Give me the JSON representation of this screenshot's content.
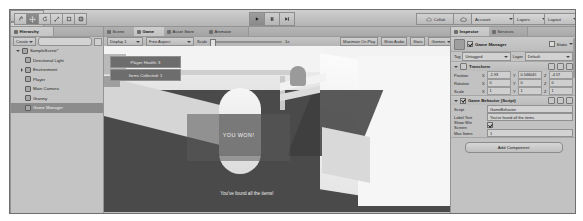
{
  "app": {
    "name": "Unity Editor"
  },
  "toolbar": {
    "tools": [
      {
        "name": "hand-tool",
        "icon": "hand-icon",
        "active": false
      },
      {
        "name": "move-tool",
        "icon": "move-icon",
        "active": true
      },
      {
        "name": "rotate-tool",
        "icon": "rotate-icon",
        "active": false
      },
      {
        "name": "scale-tool",
        "icon": "scale-icon",
        "active": false
      },
      {
        "name": "rect-tool",
        "icon": "rect-icon",
        "active": false
      },
      {
        "name": "transform-tool",
        "icon": "transform-icon",
        "active": false
      }
    ],
    "pivot_label": "Pivot",
    "local_label": "Local",
    "play_label": "play-icon",
    "pause_label": "pause-icon",
    "step_label": "step-icon",
    "play_active": true,
    "collab_label": "Collab",
    "cloud_label": "cloud-icon",
    "account_label": "Account",
    "layers_label": "Layers",
    "layout_label": "Layout"
  },
  "hierarchy": {
    "tab_label": "Hierarchy",
    "create_label": "Create",
    "search_placeholder": "",
    "items": [
      {
        "label": "SampleScene*",
        "depth": 0,
        "expanded": true,
        "selected": false,
        "is_scene": true
      },
      {
        "label": "Directional Light",
        "depth": 1,
        "expanded": false,
        "selected": false
      },
      {
        "label": "Environment",
        "depth": 1,
        "expanded": false,
        "selected": false,
        "has_children": true
      },
      {
        "label": "Player",
        "depth": 1,
        "expanded": false,
        "selected": false
      },
      {
        "label": "Main Camera",
        "depth": 1,
        "expanded": false,
        "selected": false
      },
      {
        "label": "Granny",
        "depth": 1,
        "expanded": false,
        "selected": false
      },
      {
        "label": "Game Manager",
        "depth": 1,
        "expanded": false,
        "selected": true
      }
    ]
  },
  "dock": {
    "tabs": [
      {
        "label": "Scene",
        "selected": false,
        "icon": "scene-icon"
      },
      {
        "label": "Game",
        "selected": true,
        "icon": "game-icon"
      },
      {
        "label": "Asset Store",
        "selected": false,
        "icon": "store-icon"
      },
      {
        "label": "Animator",
        "selected": false,
        "icon": "animator-icon"
      }
    ],
    "game_toolbar": {
      "display": "Display 1",
      "aspect": "Free Aspect",
      "scale_label": "Scale",
      "scale_value": "1x",
      "maximize_label": "Maximize On Play",
      "mute_label": "Mute Audio",
      "stats_label": "Stats",
      "gizmos_label": "Gizmos"
    }
  },
  "game": {
    "hud_buttons": [
      {
        "label": "Player Health: 3"
      },
      {
        "label": "Items Collected: 1"
      }
    ],
    "win_title": "YOU WON!",
    "win_subtitle": "You've found all the items!"
  },
  "inspector": {
    "tabs": [
      {
        "label": "Inspector",
        "selected": true,
        "icon": "inspector-icon"
      },
      {
        "label": "Services",
        "selected": false,
        "icon": "services-icon"
      }
    ],
    "object": {
      "name": "Game Manager",
      "enabled": true,
      "static_label": "Static",
      "tag_label": "Tag",
      "tag_value": "Untagged",
      "layer_label": "Layer",
      "layer_value": "Default"
    },
    "components": [
      {
        "title": "Transform",
        "type": "transform",
        "rows": [
          {
            "label": "Position",
            "x": "-1.93",
            "y": "0.546045",
            "z": "-4.57"
          },
          {
            "label": "Rotation",
            "x": "0",
            "y": "0",
            "z": "0"
          },
          {
            "label": "Scale",
            "x": "1",
            "y": "1",
            "z": "1"
          }
        ]
      },
      {
        "title": "Game Behavior (Script)",
        "type": "script",
        "enabled": true,
        "script_label": "Script",
        "script_value": "GameBehavior",
        "properties": [
          {
            "label": "Label Text",
            "value": "You've found all the items",
            "kind": "text"
          },
          {
            "label": "Show Win Screen",
            "value": true,
            "kind": "bool"
          },
          {
            "label": "Max Items",
            "value": "1",
            "kind": "number"
          }
        ]
      }
    ],
    "add_component_label": "Add Component"
  }
}
